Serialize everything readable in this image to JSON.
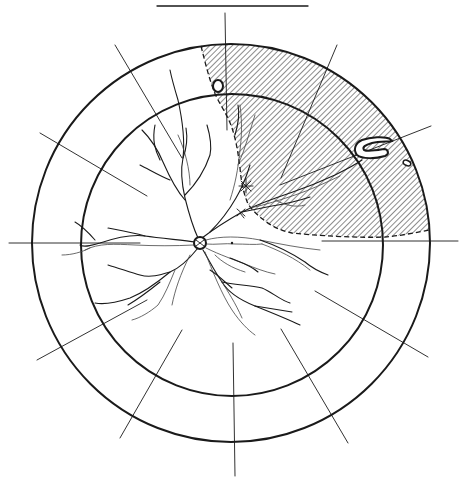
{
  "diagram": {
    "type": "fundus-retinal-detachment-chart",
    "title_rule": {
      "x1": 157,
      "y1": 6,
      "x2": 308,
      "y2": 6
    },
    "outer_circle": {
      "cx": 231,
      "cy": 243,
      "r": 199
    },
    "inner_circle": {
      "cx": 232,
      "cy": 245,
      "r": 151
    },
    "optic_disc": {
      "cx": 200,
      "cy": 243,
      "r": 6
    },
    "fovea": {
      "cx": 232,
      "cy": 243
    },
    "meridians": [
      {
        "name": "12-oclock",
        "x1": 225,
        "y1": 13,
        "x2": 227,
        "y2": 130
      },
      {
        "name": "6-oclock",
        "x1": 233,
        "y1": 343,
        "x2": 235,
        "y2": 476
      },
      {
        "name": "9-oclock",
        "x1": 9,
        "y1": 243,
        "x2": 140,
        "y2": 243
      },
      {
        "name": "3-oclock",
        "x1": 322,
        "y1": 241,
        "x2": 458,
        "y2": 241
      },
      {
        "name": "11-oclock",
        "x1": 115,
        "y1": 45,
        "x2": 182,
        "y2": 158
      },
      {
        "name": "10-oclock",
        "x1": 40,
        "y1": 133,
        "x2": 147,
        "y2": 196
      },
      {
        "name": "8-oclock",
        "x1": 37,
        "y1": 360,
        "x2": 147,
        "y2": 300
      },
      {
        "name": "7-oclock",
        "x1": 120,
        "y1": 438,
        "x2": 182,
        "y2": 330
      },
      {
        "name": "5-oclock",
        "x1": 281,
        "y1": 329,
        "x2": 348,
        "y2": 443
      },
      {
        "name": "4-oclock",
        "x1": 315,
        "y1": 291,
        "x2": 428,
        "y2": 357
      },
      {
        "name": "2-oclock",
        "x1": 280,
        "y1": 185,
        "x2": 431,
        "y2": 126
      },
      {
        "name": "1-oclock",
        "x1": 281,
        "y1": 178,
        "x2": 337,
        "y2": 45
      }
    ],
    "detachment": {
      "hatch_color": "#1a1a1a",
      "hatch_spacing": 4,
      "boundary_style": "dashed"
    },
    "lesions": {
      "horseshoe_tear": {
        "x": 355,
        "y": 137,
        "w": 38,
        "h": 20
      },
      "round_hole_upper": {
        "cx": 218,
        "cy": 86,
        "rx": 5,
        "ry": 6
      },
      "round_hole_periphery": {
        "cx": 407,
        "cy": 163,
        "rx": 4,
        "ry": 3
      },
      "star_marks": [
        {
          "x": 246,
          "y": 186
        },
        {
          "x": 241,
          "y": 212
        }
      ]
    }
  }
}
